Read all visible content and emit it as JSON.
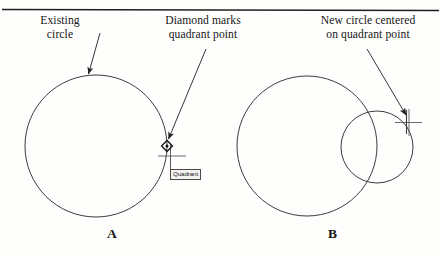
{
  "figure": {
    "title_rule": "horizontal-rule",
    "callouts": {
      "existing_circle": "Existing\ncircle",
      "existing_circle_line1": "Existing",
      "existing_circle_line2": "circle",
      "diamond_marks_line1": "Diamond marks",
      "diamond_marks_line2": "quadrant point",
      "new_circle_line1": "New circle centered",
      "new_circle_line2": "on quadrant point"
    },
    "tooltip": {
      "label": "Quadrant"
    },
    "panels": [
      {
        "letter": "A"
      },
      {
        "letter": "B"
      }
    ],
    "panel_a_letter": "A",
    "panel_b_letter": "B",
    "colors": {
      "ink": "#1a1a1a",
      "geometry_stroke": "#3c3c3c",
      "leader_stroke": "#2b2b2b",
      "tooltip_border": "#4a4a4a",
      "tooltip_fill": "#f3f2ef",
      "page_background": "#fefefd"
    },
    "geometry": {
      "panel_a_circle": {
        "cx": 96,
        "cy": 146,
        "r": 71
      },
      "panel_a_quadrant_point": {
        "x": 167,
        "y": 146
      },
      "panel_b_existing_circle": {
        "cx": 307,
        "cy": 146,
        "r": 70
      },
      "panel_b_new_circle": {
        "cx": 377,
        "cy": 147,
        "r": 36
      },
      "panel_b_crosshair_point": {
        "x": 409,
        "y": 122
      }
    }
  }
}
